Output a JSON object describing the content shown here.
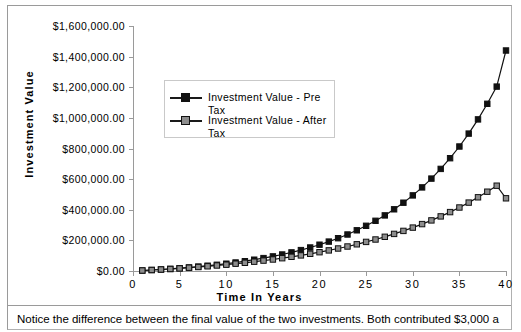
{
  "chart_data": {
    "type": "line",
    "title": "",
    "xlabel": "Time  In  Years",
    "ylabel": "Investment  Value",
    "xlim": [
      0,
      40
    ],
    "ylim": [
      0,
      1600000
    ],
    "grid": false,
    "legend_position": "inside-upper-left",
    "x_ticklabels": [
      "0",
      "5",
      "10",
      "15",
      "20",
      "25",
      "30",
      "35",
      "40"
    ],
    "x_tickvalues": [
      0,
      5,
      10,
      15,
      20,
      25,
      30,
      35,
      40
    ],
    "y_ticklabels": [
      "$0.00",
      "$200,000.00",
      "$400,000.00",
      "$600,000.00",
      "$800,000.00",
      "$1,000,000.00",
      "$1,200,000.00",
      "$1,400,000.00",
      "$1,600,000.00"
    ],
    "y_tickvalues": [
      0,
      200000,
      400000,
      600000,
      800000,
      1000000,
      1200000,
      1400000,
      1600000
    ],
    "x": [
      1,
      2,
      3,
      4,
      5,
      6,
      7,
      8,
      9,
      10,
      11,
      12,
      13,
      14,
      15,
      16,
      17,
      18,
      19,
      20,
      21,
      22,
      23,
      24,
      25,
      26,
      27,
      28,
      29,
      30,
      31,
      32,
      33,
      34,
      35,
      36,
      37,
      38,
      39,
      40
    ],
    "series": [
      {
        "name": "Investment Value - Pre Tax",
        "marker": "filled-square",
        "color": "#111111",
        "values": [
          3000,
          6300,
          9930,
          13923,
          18315,
          23147,
          28462,
          34308,
          40738,
          47812,
          55593,
          64153,
          73568,
          83925,
          95317,
          107849,
          121634,
          136797,
          153477,
          171825,
          192007,
          214208,
          238629,
          265492,
          295041,
          327545,
          363299,
          402629,
          445892,
          493481,
          545829,
          603412,
          666753,
          736429,
          813072,
          897379,
          990117,
          1092128,
          1204341,
          1440000
        ]
      },
      {
        "name": "Investment Value - After Tax",
        "marker": "open-square",
        "color": "#8d8d8d",
        "values": [
          3000,
          6210,
          9645,
          13320,
          17252,
          21460,
          25962,
          30779,
          35934,
          41450,
          47351,
          53666,
          60423,
          67652,
          75388,
          83665,
          92521,
          101998,
          112138,
          122987,
          134597,
          147019,
          160310,
          174532,
          189749,
          206032,
          223454,
          242096,
          262043,
          283386,
          306223,
          330659,
          356805,
          384782,
          414717,
          446748,
          481020,
          517691,
          556929,
          475000
        ]
      }
    ]
  },
  "caption": {
    "text": "Notice the difference between the final value of the two investments.  Both contributed $3,000 a"
  },
  "legend": {
    "items": [
      {
        "label": "Investment Value - Pre Tax"
      },
      {
        "label": "Investment Value - After Tax"
      }
    ]
  }
}
